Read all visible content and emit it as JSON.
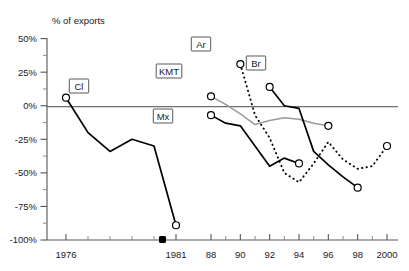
{
  "chart_data": {
    "type": "line",
    "title": "",
    "subtitle": "",
    "ylabel": "% of exports",
    "xlabel": "",
    "ylim": [
      -100,
      50
    ],
    "y_ticks": [
      "50%",
      "25%",
      "0%",
      "-25%",
      "-50%",
      "-75%",
      "-100%"
    ],
    "y_tick_values": [
      50,
      25,
      0,
      -25,
      -50,
      -75,
      -100
    ],
    "y_minor_step": 12.5,
    "x_tick_labels": [
      "1976",
      "1981",
      "88",
      "90",
      "92",
      "94",
      "96",
      "98",
      "2000"
    ],
    "x_tick_values": [
      1976,
      1981,
      1988,
      1990,
      1992,
      1994,
      1996,
      1998,
      2000
    ],
    "axis_break": {
      "present": true,
      "between": [
        1981,
        1988
      ],
      "marker": "filled-square"
    },
    "grid": false,
    "legend": "inline-tags",
    "zero_reference_line": true,
    "series": [
      {
        "name": "Cl",
        "style": "solid",
        "color": "#000000",
        "endpoint_markers": [
          1976,
          1981
        ],
        "x": [
          1976,
          1977,
          1978,
          1979,
          1980,
          1981
        ],
        "values": [
          6,
          -20,
          -34,
          -25,
          -30,
          -89
        ]
      },
      {
        "name": "KMT",
        "style": "solid-gray",
        "color": "#9a9a9a",
        "endpoint_markers": [
          1988,
          1996
        ],
        "x": [
          1988,
          1989,
          1990,
          1991,
          1992,
          1993,
          1994,
          1995,
          1996
        ],
        "values": [
          7,
          1,
          -6,
          -14,
          -11,
          -9,
          -10,
          -13,
          -15
        ]
      },
      {
        "name": "Mx",
        "style": "solid",
        "color": "#000000",
        "endpoint_markers": [
          1988,
          1994
        ],
        "x": [
          1988,
          1989,
          1990,
          1991,
          1992,
          1993,
          1994
        ],
        "values": [
          -7,
          -13,
          -15,
          -30,
          -45,
          -39,
          -43
        ]
      },
      {
        "name": "Ar",
        "style": "dotted",
        "color": "#000000",
        "endpoint_markers": [
          1990,
          2000
        ],
        "x": [
          1990,
          1991,
          1992,
          1993,
          1994,
          1995,
          1996,
          1997,
          1998,
          1999,
          2000
        ],
        "values": [
          31,
          -7,
          -24,
          -50,
          -57,
          -43,
          -27,
          -40,
          -47,
          -45,
          -30
        ]
      },
      {
        "name": "Br",
        "style": "solid",
        "color": "#000000",
        "endpoint_markers": [
          1992,
          1998
        ],
        "x": [
          1992,
          1993,
          1994,
          1995,
          1996,
          1997,
          1998
        ],
        "values": [
          14,
          0,
          -2,
          -34,
          -44,
          -53,
          -61
        ]
      }
    ],
    "series_tags": [
      {
        "label": "Cl",
        "x": 79,
        "y": 86
      },
      {
        "label": "KMT",
        "x": 169,
        "y": 71
      },
      {
        "label": "Mx",
        "x": 163,
        "y": 116
      },
      {
        "label": "Ar",
        "x": 201,
        "y": 44
      },
      {
        "label": "Br",
        "x": 256,
        "y": 63
      }
    ]
  }
}
